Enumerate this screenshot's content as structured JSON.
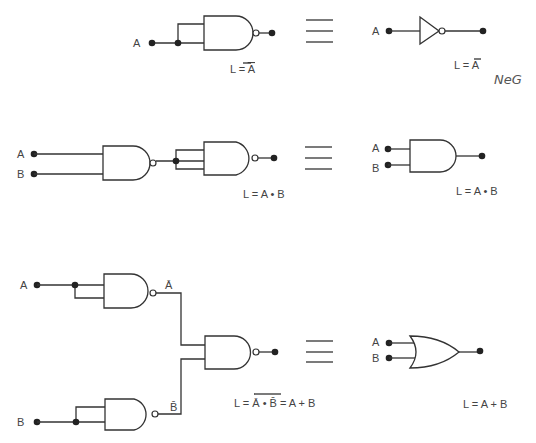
{
  "diagram": {
    "rows": [
      {
        "name": "not-from-nand",
        "inputs": [
          "A"
        ],
        "left_formula": "L = Ā",
        "right_gate": "NOT",
        "right_inputs": [
          "A"
        ],
        "right_formula": "L = Ā",
        "annotation": "NeG"
      },
      {
        "name": "and-from-nand",
        "inputs": [
          "A",
          "B"
        ],
        "left_formula": "L = A • B",
        "right_gate": "AND",
        "right_inputs": [
          "A",
          "B"
        ],
        "right_formula": "L = A • B"
      },
      {
        "name": "or-from-nand",
        "inputs": [
          "A",
          "B"
        ],
        "intermediate": [
          "Ā",
          "B̄"
        ],
        "left_formula": {
          "prefix": "L = ",
          "overlined": "Ā • B̄",
          "suffix": " = A + B"
        },
        "right_gate": "OR",
        "right_inputs": [
          "A",
          "B"
        ],
        "right_formula": "L = A + B"
      }
    ],
    "equivalence_symbol": "≡"
  }
}
